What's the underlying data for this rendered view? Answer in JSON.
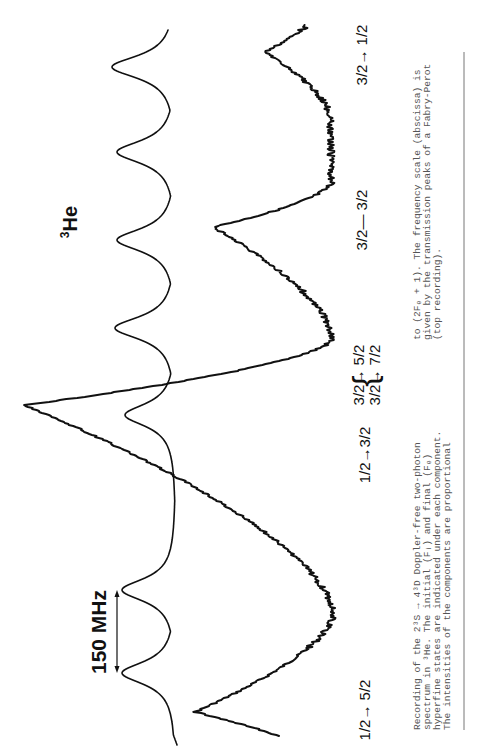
{
  "figure": {
    "element_label": "3He",
    "element_mass_number": "3",
    "element_symbol": "He",
    "scale_bar_label": "150 MHz",
    "transition_labels": [
      {
        "id": "t1",
        "text": "1/2→ 5/2"
      },
      {
        "id": "t2",
        "text": "1/2→3/2"
      },
      {
        "id": "t3",
        "text": "3/2→ 5/2"
      },
      {
        "id": "t4",
        "text": "3/2→ 7/2"
      },
      {
        "id": "t5",
        "text": "3/2— 3/2"
      },
      {
        "id": "t6",
        "text": "3/2→ 1/2"
      }
    ],
    "brace": "{"
  },
  "caption": {
    "col1": [
      "Recording of the 2³S → 4³D Doppler-free two-photon",
      "spectrum in ³He. The initial (Fᵢ) and final (Fₑ)",
      "hyperfine states are indicated under each component.",
      "The intensities of the components are proportional"
    ],
    "col2": [
      "to (2Fₑ + 1). The frequency scale (abscissa) is",
      "given by the transmission peaks of a Fabry-Perot",
      "(top recording)."
    ]
  },
  "chart_data": {
    "type": "line",
    "xlabel": "Frequency (abscissa)",
    "ylabel": "Signal intensity (arb.)",
    "orientation": "rotated 90° counter-clockwise on page",
    "scale_bar": {
      "label": "150 MHz",
      "spans": "adjacent Fabry-Perot transmission peaks"
    },
    "grid": false,
    "legend": null,
    "series": [
      {
        "name": "Fabry-Perot transmission (top recording)",
        "style": "smooth periodic",
        "peak_positions_page_y": [
          673,
          590,
          415,
          328,
          240,
          152,
          67
        ],
        "peak_height_rel": [
          1.0,
          1.0,
          1.0,
          1.0,
          1.0,
          1.0,
          1.0
        ],
        "free_spectral_range_MHz": 150
      },
      {
        "name": "Two-photon spectrum",
        "style": "noisy",
        "peaks": [
          {
            "label": "1/2→5/2",
            "page_y": 712,
            "rel_intensity": 0.44
          },
          {
            "label": "1/2→3/2",
            "page_y": 471,
            "rel_intensity": 0.38
          },
          {
            "label": "3/2→5/2 + 3/2→7/2",
            "page_y": 405,
            "rel_intensity": 1.0
          },
          {
            "label": "shoulder",
            "page_y": 440,
            "rel_intensity": 0.12
          },
          {
            "label": "3/2→3/2",
            "page_y": 227,
            "rel_intensity": 0.4
          },
          {
            "label": "3/2→1/2",
            "page_y": 52,
            "rel_intensity": 0.22
          }
        ]
      }
    ],
    "geometry": {
      "fp": {
        "baseline_x": 176,
        "dip_x": [
          122,
          122,
          125,
          115,
          117,
          117,
          112
        ],
        "y_start": 745,
        "y_end": 30,
        "x_start": 178,
        "x_end": 166
      },
      "spec": {
        "baseline_x": 335,
        "y_start": 736,
        "y_end": 25,
        "x_start": 332,
        "x_end": 327,
        "peaks": [
          {
            "y": 712,
            "x": 195,
            "wl": 25,
            "wr": 45
          },
          {
            "y": 471,
            "x": 220,
            "wl": 40,
            "wr": 30
          },
          {
            "y": 440,
            "x": 300,
            "wl": 8,
            "wr": 10
          },
          {
            "y": 405,
            "x": 25,
            "wl": 95,
            "wr": 30
          },
          {
            "y": 227,
            "x": 213,
            "wl": 50,
            "wr": 20
          },
          {
            "y": 52,
            "x": 265,
            "wl": 30,
            "wr": 25
          }
        ]
      }
    }
  }
}
